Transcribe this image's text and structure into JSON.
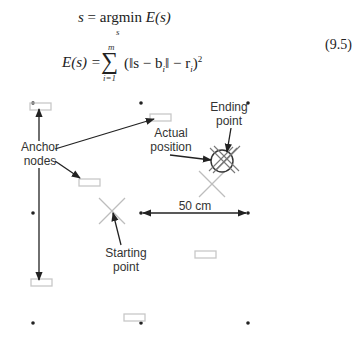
{
  "equation": {
    "line1_lhs": "s",
    "line1_op": "argmin",
    "line1_rhs": "E(s)",
    "line1_sub": "s",
    "line2_lhs": "E(s) =",
    "sum_top": "m",
    "sum_bottom": "i=1",
    "line2_rhs": "(‖s − b",
    "line2_rhs_sub_i": "i",
    "line2_rhs_mid": "‖ − r",
    "line2_rhs_tail": ")",
    "line2_exp": "2",
    "number": "(9.5)"
  },
  "diagram": {
    "labels": {
      "anchor_line1": "Anchor",
      "anchor_line2": "nodes",
      "actual_line1": "Actual",
      "actual_line2": "position",
      "ending_line1": "Ending",
      "ending_line2": "point",
      "starting_line1": "Starting",
      "starting_line2": "point",
      "distance": "50 cm"
    },
    "colors": {
      "ink": "#222222",
      "light_gray": "#bdbdbd",
      "rect_gray": "#c8c8c8"
    }
  }
}
